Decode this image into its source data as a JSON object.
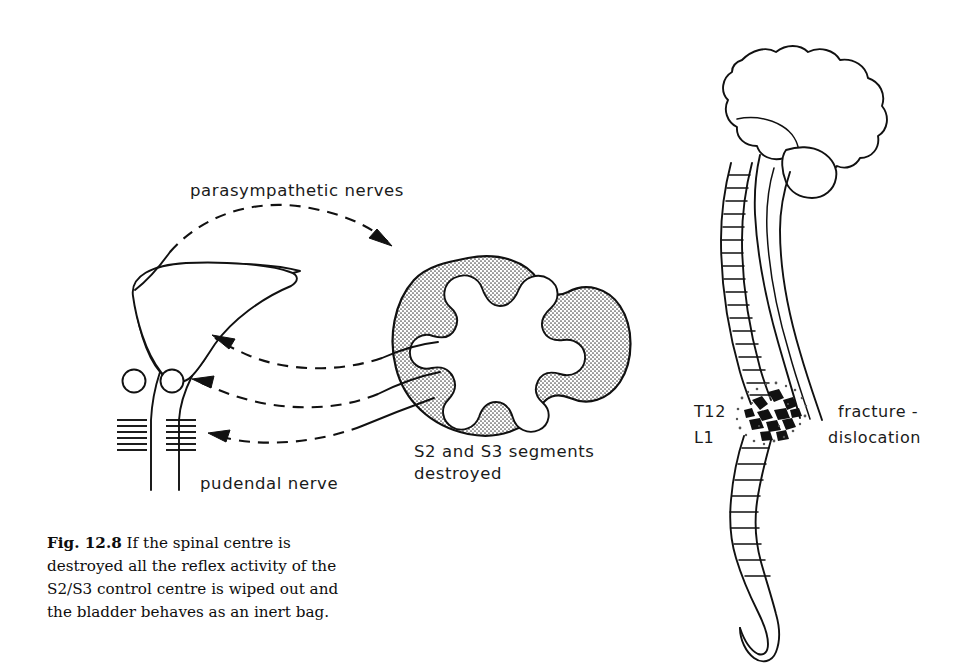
{
  "figure": {
    "id": "fig-12-8",
    "background_color": "#ffffff",
    "ink_color": "#111111",
    "width": 959,
    "height": 672
  },
  "caption": {
    "figure_number": "Fig. 12.8",
    "lines": [
      "If the spinal centre is",
      "destroyed all the reflex activity of the",
      "S2/S3 control centre is wiped out and",
      "the bladder behaves as an inert bag."
    ],
    "full_text": "Fig. 12.8 If the spinal centre is destroyed all the reflex activity of the S2/S3 control centre is wiped out and the bladder behaves as an inert bag."
  },
  "left_panel": {
    "name": "bladder-and-cord-diagram",
    "labels": {
      "parasympathetic": "parasympathetic  nerves",
      "pudendal": "pudendal  nerve",
      "segments_line1": "S2 and S3 segments",
      "segments_line2": "destroyed"
    },
    "structures": {
      "bladder": "bladder",
      "urethra": "urethra",
      "internal_sphincter": "internal-sphincter",
      "external_sphincter": "external-sphincter",
      "pelvic_floor_muscle": "pelvic-floor-hatching",
      "spinal_cord_section": "spinal-cord-cross-section",
      "gray_matter": "butterfly-gray-matter"
    },
    "connections": [
      {
        "name": "parasympathetic-arrow",
        "from": "bladder-dome",
        "to": "spinal-cord",
        "style": "dashed",
        "direction": "to-cord"
      },
      {
        "name": "motor-arrow-bladder",
        "from": "spinal-cord",
        "to": "bladder-neck",
        "style": "dashed",
        "direction": "to-bladder"
      },
      {
        "name": "motor-arrow-sphincter",
        "from": "spinal-cord",
        "to": "external-sphincter",
        "style": "dashed",
        "direction": "to-bladder"
      },
      {
        "name": "motor-arrow-pelvic-floor",
        "from": "spinal-cord",
        "to": "pelvic-floor",
        "style": "dashed",
        "direction": "to-bladder"
      }
    ]
  },
  "right_panel": {
    "name": "spine-and-brain-diagram",
    "labels": {
      "level_upper": "T12",
      "level_lower": "L1",
      "injury_line1": "fracture -",
      "injury_line2": "dislocation"
    },
    "structures": {
      "brain": "brain",
      "cerebellum": "cerebellum",
      "brainstem": "brainstem",
      "vertebral_column": "vertebral-column",
      "spinal_cord": "spinal-cord",
      "cauda_equina": "cauda-equina",
      "fracture_site": "fracture-dislocation-site"
    }
  }
}
